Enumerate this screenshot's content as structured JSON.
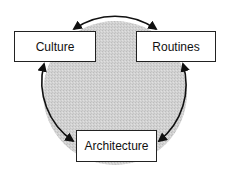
{
  "diagram": {
    "type": "cycle",
    "nodes": [
      {
        "id": "culture",
        "label": "Culture"
      },
      {
        "id": "routines",
        "label": "Routines"
      },
      {
        "id": "architecture",
        "label": "Architecture"
      }
    ],
    "edges": [
      {
        "from": "culture",
        "to": "routines",
        "bidirectional": true
      },
      {
        "from": "routines",
        "to": "architecture",
        "bidirectional": true
      },
      {
        "from": "architecture",
        "to": "culture",
        "bidirectional": true
      }
    ],
    "colors": {
      "circle_fill": "#cfcfcf",
      "stroke": "#111111",
      "box_fill": "#ffffff"
    }
  }
}
